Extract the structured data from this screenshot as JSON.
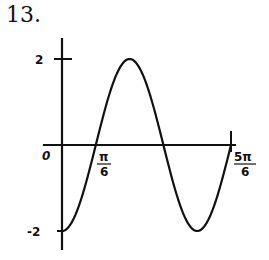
{
  "problem_number": "13.",
  "chart_data": {
    "type": "line",
    "title": "",
    "function": "y = -2cos(3x)",
    "xlabel": "",
    "ylabel": "",
    "x_tick_labels": [
      "0",
      "π/6",
      "5π/6"
    ],
    "y_tick_labels": [
      "2",
      "-2"
    ],
    "xlim": [
      0,
      2.618
    ],
    "ylim": [
      -2,
      2
    ],
    "grid": false,
    "series": [
      {
        "name": "curve",
        "x": [
          0,
          0.5236,
          1.0472,
          1.5708,
          2.0944,
          2.618
        ],
        "x_labels": [
          "0",
          "π/6",
          "π/3",
          "π/2",
          "2π/3",
          "5π/6"
        ],
        "values": [
          -2,
          0,
          2,
          0,
          -2,
          0
        ]
      }
    ]
  },
  "labels": {
    "origin": "0",
    "pi6_num": "π",
    "pi6_den": "6",
    "fivepi6_num": "5π",
    "fivepi6_den": "6",
    "y_top": "2",
    "y_bottom": "-2"
  }
}
